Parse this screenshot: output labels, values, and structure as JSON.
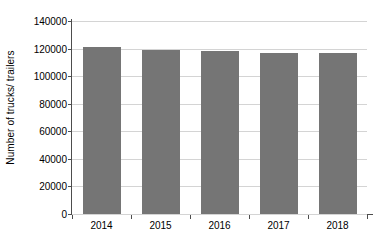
{
  "chart_data": {
    "type": "bar",
    "title": "",
    "xlabel": "",
    "ylabel": "Number of trucks/ trailers",
    "categories": [
      "2014",
      "2015",
      "2016",
      "2017",
      "2018"
    ],
    "values": [
      121500,
      119000,
      118000,
      116500,
      116500
    ],
    "series": [
      {
        "name": "Number of trucks/ trailers",
        "values": [
          121500,
          119000,
          118000,
          116500,
          116500
        ]
      }
    ],
    "ylim": [
      0,
      140000
    ],
    "ytick_values": [
      0,
      20000,
      40000,
      60000,
      80000,
      100000,
      120000,
      140000
    ],
    "ytick_labels": [
      "0",
      "20000",
      "40000",
      "60000",
      "80000",
      "100000",
      "120000",
      "140000"
    ],
    "grid": true,
    "grid_axis": "y",
    "legend": false,
    "legend_position": "none",
    "bar_color": "#757575",
    "gridline_color": "#d4d4d4",
    "axis_color": "#4d4d4d",
    "background_color": "#ffffff"
  }
}
